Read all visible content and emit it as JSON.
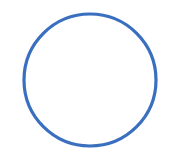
{
  "shape": {
    "type": "circle-outline",
    "cx": 90,
    "cy": 80,
    "r": 66,
    "stroke_width": 3.2,
    "stroke_color": "#3a6fc0",
    "fill": "none"
  },
  "background": "#ffffff"
}
